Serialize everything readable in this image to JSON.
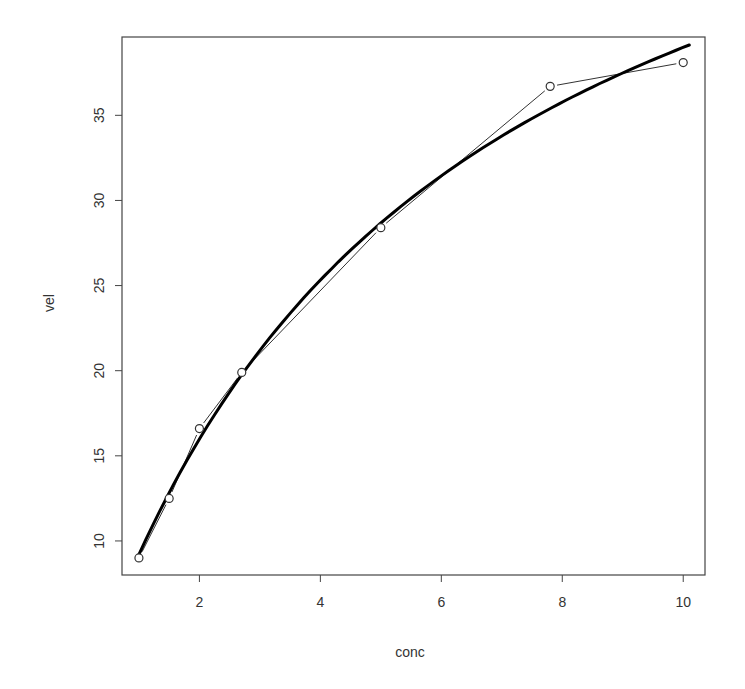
{
  "chart_data": {
    "type": "scatter",
    "title": "",
    "xlabel": "conc",
    "ylabel": "vel",
    "xlim": [
      0.72,
      10.36
    ],
    "ylim": [
      8.0,
      39.6
    ],
    "xticks": [
      2,
      4,
      6,
      8,
      10
    ],
    "yticks": [
      10,
      15,
      20,
      25,
      30,
      35
    ],
    "grid": false,
    "legend": null,
    "series": [
      {
        "name": "observed",
        "style": "points-and-lines",
        "marker": "open-circle",
        "color": "#333333",
        "x": [
          1.0,
          1.5,
          2.0,
          2.7,
          5.0,
          7.8,
          10.0
        ],
        "y": [
          9.0,
          12.5,
          16.6,
          19.9,
          28.4,
          36.7,
          38.1
        ]
      },
      {
        "name": "fitted curve",
        "style": "line",
        "color": "#000000",
        "line_width": 3,
        "model": "vel = Vmax * conc / (Km + conc)",
        "params": {
          "Vmax": 60.9,
          "Km": 5.62
        },
        "x_range": [
          1.0,
          10.1
        ]
      }
    ]
  }
}
